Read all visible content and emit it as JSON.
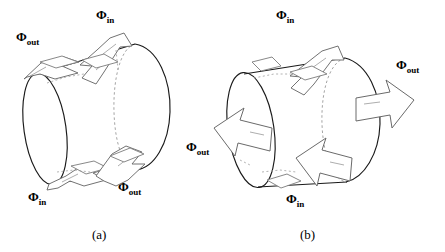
{
  "figure": {
    "background_color": "#ffffff",
    "stroke_color": "#1a1a1a",
    "arrow_stroke_color": "#555555",
    "dashed_stroke_color": "#888888",
    "panels": [
      {
        "id": "a",
        "caption": "(a)",
        "description": "tilted cylinder with flux arrows piercing the lateral surface",
        "labels": [
          {
            "name": "flux-out-top-left",
            "symbol": "Φ",
            "subscript": "out",
            "x": 16,
            "y": 30
          },
          {
            "name": "flux-in-top",
            "symbol": "Φ",
            "subscript": "in",
            "x": 96,
            "y": 8
          },
          {
            "name": "flux-in-bottom-left",
            "symbol": "Φ",
            "subscript": "in",
            "x": 28,
            "y": 190
          },
          {
            "name": "flux-out-bottom",
            "symbol": "Φ",
            "subscript": "out",
            "x": 118,
            "y": 180
          }
        ]
      },
      {
        "id": "b",
        "caption": "(b)",
        "description": "tilted cylinder with flux arrows entering and exiting through the flat end caps",
        "labels": [
          {
            "name": "flux-in-top",
            "symbol": "Φ",
            "subscript": "in",
            "x": 276,
            "y": 8
          },
          {
            "name": "flux-out-right",
            "symbol": "Φ",
            "subscript": "out",
            "x": 396,
            "y": 58
          },
          {
            "name": "flux-out-left",
            "symbol": "Φ",
            "subscript": "out",
            "x": 186,
            "y": 140
          },
          {
            "name": "flux-in-bottom",
            "symbol": "Φ",
            "subscript": "in",
            "x": 286,
            "y": 192
          }
        ]
      }
    ],
    "caption_a": {
      "text": "(a)",
      "x": 92,
      "y": 228
    },
    "caption_b": {
      "text": "(b)",
      "x": 300,
      "y": 228
    }
  }
}
